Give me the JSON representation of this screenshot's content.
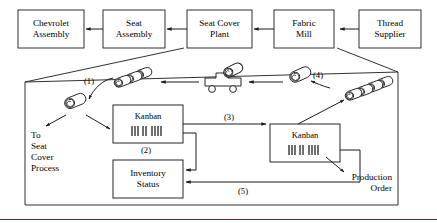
{
  "diagram": {
    "type": "process-flow-diagram",
    "stroke_color": "#1a1a1a",
    "rule_color": "#6b2b25",
    "background": "#ffffff"
  },
  "supply_chain": {
    "nodes": [
      {
        "id": "chevrolet-assembly",
        "label": "Chevrolet\nAssembly",
        "x": 18,
        "y": 10,
        "w": 66,
        "h": 38
      },
      {
        "id": "seat-assembly",
        "label": "Seat\nAssembly",
        "x": 103,
        "y": 10,
        "w": 62,
        "h": 38
      },
      {
        "id": "seat-cover-plant",
        "label": "Seat Cover\nPlant",
        "x": 187,
        "y": 10,
        "w": 65,
        "h": 38
      },
      {
        "id": "fabric-mill",
        "label": "Fabric\nMill",
        "x": 274,
        "y": 10,
        "w": 60,
        "h": 38
      },
      {
        "id": "thread-supplier",
        "label": "Thread\nSupplier",
        "x": 359,
        "y": 10,
        "w": 62,
        "h": 38
      }
    ],
    "arrows": [
      {
        "from": "seat-assembly",
        "to": "chevrolet-assembly",
        "direction": "left"
      },
      {
        "from": "seat-cover-plant",
        "to": "seat-assembly",
        "direction": "left"
      },
      {
        "from": "fabric-mill",
        "to": "seat-cover-plant",
        "direction": "left"
      },
      {
        "from": "thread-supplier",
        "to": "fabric-mill",
        "direction": "left"
      }
    ]
  },
  "detail_panel": {
    "magnified_from": [
      "seat-cover-plant",
      "fabric-mill"
    ],
    "boxes": [
      {
        "id": "kanban-left",
        "label": "Kanban",
        "barcode": "||| || ||||",
        "x": 113,
        "y": 105,
        "w": 70,
        "h": 38
      },
      {
        "id": "kanban-right",
        "label": "Kanban",
        "barcode": "||| || ||||",
        "x": 270,
        "y": 124,
        "w": 70,
        "h": 38
      },
      {
        "id": "inventory-status",
        "label": "Inventory\nStatus",
        "x": 113,
        "y": 160,
        "w": 70,
        "h": 38
      }
    ],
    "free_labels": [
      {
        "id": "to-seat-cover-process",
        "text": "To\nSeat\nCover\nProcess",
        "x": 31,
        "y": 130
      },
      {
        "id": "production-order",
        "text": "Production\nOrder",
        "x": 334,
        "y": 175
      }
    ],
    "flow_labels": [
      {
        "id": "flow-1",
        "text": "(1)",
        "x": 84,
        "y": 76
      },
      {
        "id": "flow-2",
        "text": "(2)",
        "x": 141,
        "y": 147
      },
      {
        "id": "flow-3",
        "text": "(3)",
        "x": 224,
        "y": 116
      },
      {
        "id": "flow-4",
        "text": "(4)",
        "x": 313,
        "y": 73
      },
      {
        "id": "flow-5",
        "text": "(5)",
        "x": 238,
        "y": 190
      }
    ],
    "icons": [
      {
        "id": "fabric-roll-stack-left",
        "type": "fabric-roll",
        "count": 3,
        "x": 110,
        "y": 74
      },
      {
        "id": "fabric-roll-single-left",
        "type": "fabric-roll",
        "count": 1,
        "x": 63,
        "y": 102
      },
      {
        "id": "delivery-truck",
        "type": "truck-with-roll",
        "count": 1,
        "x": 205,
        "y": 73
      },
      {
        "id": "fabric-roll-single-right",
        "type": "fabric-roll",
        "count": 1,
        "x": 288,
        "y": 76
      },
      {
        "id": "fabric-roll-stack-right",
        "type": "fabric-roll",
        "count": 4,
        "x": 344,
        "y": 86
      }
    ]
  }
}
